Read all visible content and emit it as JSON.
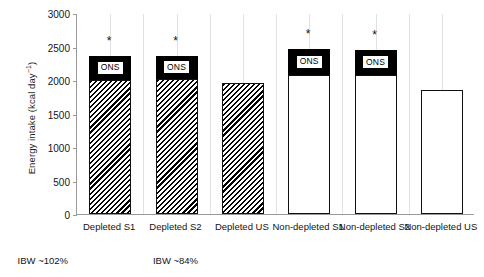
{
  "chart_data": {
    "type": "bar",
    "title": "",
    "xlabel": "",
    "ylabel": "Energy intake (kcal day⁻¹)",
    "ylim": [
      0,
      3000
    ],
    "ytick_values": [
      0,
      500,
      1000,
      1500,
      2000,
      2500,
      3000
    ],
    "ytick_labels": [
      "0",
      "500",
      "1000",
      "1500",
      "2000",
      "2500",
      "3000"
    ],
    "grid": false,
    "legend": "none",
    "categories": [
      "Depleted S1",
      "Depleted S2",
      "Depleted US",
      "Non-depleted\nS1",
      "Non-depleted\nS2",
      "Non-depleted\nUS"
    ],
    "bars": [
      {
        "category": "Depleted S1",
        "base_value": 2000,
        "total_value": 2360,
        "ons_value": 360,
        "fill": "hatched",
        "ons_label": "ONS",
        "has_ons": true,
        "significance": "*"
      },
      {
        "category": "Depleted S2",
        "base_value": 2010,
        "total_value": 2365,
        "ons_value": 355,
        "fill": "hatched",
        "ons_label": "ONS",
        "has_ons": true,
        "significance": "*"
      },
      {
        "category": "Depleted US",
        "base_value": 1950,
        "total_value": 1950,
        "ons_value": 0,
        "fill": "hatched",
        "ons_label": "",
        "has_ons": false,
        "significance": ""
      },
      {
        "category": "Non-depleted S1",
        "base_value": 2080,
        "total_value": 2460,
        "ons_value": 380,
        "fill": "plain",
        "ons_label": "ONS",
        "has_ons": true,
        "significance": "*"
      },
      {
        "category": "Non-depleted S2",
        "base_value": 2080,
        "total_value": 2455,
        "ons_value": 375,
        "fill": "plain",
        "ons_label": "ONS",
        "has_ons": true,
        "significance": "*"
      },
      {
        "category": "Non-depleted US",
        "base_value": 1850,
        "total_value": 1850,
        "ons_value": 0,
        "fill": "plain",
        "ons_label": "",
        "has_ons": false,
        "significance": ""
      }
    ],
    "groups": [
      {
        "label": "IBW ~84%",
        "covers": [
          "Depleted S1",
          "Depleted S2",
          "Depleted US"
        ]
      },
      {
        "label": "IBW ~102%",
        "covers": [
          "Non-depleted S1",
          "Non-depleted S2",
          "Non-depleted US"
        ]
      }
    ],
    "colors": {
      "ons_block": "#000000",
      "bar_outline": "#000000",
      "bar_fill": "#ffffff",
      "axis": "#9a9a9a",
      "text": "#141414"
    }
  }
}
